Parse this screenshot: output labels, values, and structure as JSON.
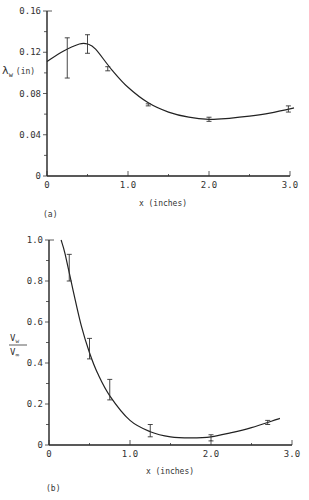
{
  "chart_data": [
    {
      "type": "line",
      "panel_label": "(a)",
      "title": "",
      "xlabel": "x (inches)",
      "ylabel": "λw (in)",
      "ylabel_main": "λ",
      "ylabel_sub": "w",
      "ylabel_unit": "(in)",
      "xlim": [
        0,
        3.0
      ],
      "ylim": [
        0,
        0.16
      ],
      "xticks": [
        "0",
        "1.0",
        "2.0",
        "3.0"
      ],
      "yticks": [
        "0",
        "0.04",
        "0.08",
        "0.12",
        "0.16"
      ],
      "grid": false,
      "series": [
        {
          "name": "measured",
          "points": [
            {
              "x": 0.25,
              "y": 0.115,
              "err_low": 0.095,
              "err_high": 0.134
            },
            {
              "x": 0.5,
              "y": 0.128,
              "err_low": 0.119,
              "err_high": 0.137
            },
            {
              "x": 0.75,
              "y": 0.104,
              "err_low": 0.102,
              "err_high": 0.106
            },
            {
              "x": 1.25,
              "y": 0.069,
              "err_low": 0.068,
              "err_high": 0.07
            },
            {
              "x": 2.0,
              "y": 0.055,
              "err_low": 0.053,
              "err_high": 0.057
            },
            {
              "x": 2.98,
              "y": 0.065,
              "err_low": 0.062,
              "err_high": 0.068
            }
          ]
        },
        {
          "name": "fit",
          "x": [
            0,
            0.2,
            0.4,
            0.5,
            0.6,
            0.8,
            1.0,
            1.25,
            1.5,
            1.75,
            2.0,
            2.25,
            2.5,
            2.75,
            3.05
          ],
          "y": [
            0.111,
            0.121,
            0.128,
            0.128,
            0.123,
            0.103,
            0.086,
            0.071,
            0.062,
            0.057,
            0.055,
            0.056,
            0.058,
            0.061,
            0.066
          ]
        }
      ]
    },
    {
      "type": "line",
      "panel_label": "(b)",
      "title": "",
      "xlabel": "x (inches)",
      "ylabel": "Vw / V∞",
      "ylabel_num": "V",
      "ylabel_num_sub": "w",
      "ylabel_den": "V",
      "ylabel_den_sub": "∞",
      "xlim": [
        0,
        3.0
      ],
      "ylim": [
        0,
        1.0
      ],
      "xticks": [
        "0",
        "1.0",
        "2.0",
        "3.0"
      ],
      "yticks": [
        "0",
        "0.2",
        "0.4",
        "0.6",
        "0.8",
        "1.0"
      ],
      "grid": false,
      "series": [
        {
          "name": "measured",
          "points": [
            {
              "x": 0.25,
              "y": 0.86,
              "err_low": 0.8,
              "err_high": 0.93
            },
            {
              "x": 0.5,
              "y": 0.44,
              "err_low": 0.42,
              "err_high": 0.52
            },
            {
              "x": 0.75,
              "y": 0.23,
              "err_low": 0.22,
              "err_high": 0.32
            },
            {
              "x": 1.25,
              "y": 0.07,
              "err_low": 0.04,
              "err_high": 0.1
            },
            {
              "x": 2.0,
              "y": 0.04,
              "err_low": 0.02,
              "err_high": 0.05
            },
            {
              "x": 2.7,
              "y": 0.11,
              "err_low": 0.1,
              "err_high": 0.12
            }
          ]
        },
        {
          "name": "fit",
          "x": [
            0.15,
            0.2,
            0.3,
            0.4,
            0.5,
            0.6,
            0.75,
            1.0,
            1.25,
            1.5,
            1.75,
            2.0,
            2.25,
            2.5,
            2.85
          ],
          "y": [
            1.0,
            0.93,
            0.75,
            0.58,
            0.45,
            0.35,
            0.24,
            0.12,
            0.065,
            0.04,
            0.035,
            0.04,
            0.06,
            0.085,
            0.13
          ]
        }
      ]
    }
  ]
}
